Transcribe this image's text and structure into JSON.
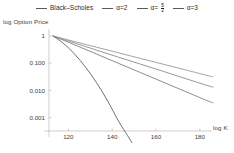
{
  "chart_data": {
    "type": "line",
    "title": "",
    "xlabel": "log K",
    "ylabel": "log Option Price",
    "xlim": [
      112,
      186
    ],
    "ylim": [
      0.0004,
      1.45
    ],
    "yscale": "log",
    "grid": false,
    "legend_position": "top",
    "xticks": [
      120,
      140,
      160,
      180
    ],
    "xtick_labels": [
      "120",
      "140",
      "160",
      "180"
    ],
    "yticks": [
      1,
      0.1,
      0.01,
      0.001
    ],
    "ytick_labels": [
      "1",
      "0.100",
      "0.010",
      "0.001"
    ],
    "series": [
      {
        "name": "Black-Scholes",
        "color": "#4c4c4c",
        "x": [
          113,
          118,
          123,
          128,
          133,
          138,
          143,
          147,
          149
        ],
        "y": [
          1.0,
          0.52,
          0.21,
          0.069,
          0.0185,
          0.004,
          0.00072,
          0.00022,
          0.00012
        ]
      },
      {
        "name": "alpha=2",
        "color": "#6e6e6e",
        "x": [
          113,
          123,
          133,
          143,
          153,
          163,
          173,
          183,
          186
        ],
        "y": [
          1.0,
          0.47,
          0.215,
          0.098,
          0.045,
          0.0205,
          0.0094,
          0.0043,
          0.0035
        ]
      },
      {
        "name": "alpha=5/2",
        "color": "#7d7d7d",
        "x": [
          113,
          123,
          133,
          143,
          153,
          163,
          173,
          183,
          186
        ],
        "y": [
          1.0,
          0.55,
          0.3,
          0.165,
          0.092,
          0.051,
          0.028,
          0.0155,
          0.0132
        ]
      },
      {
        "name": "alpha=3",
        "color": "#8c8c8c",
        "x": [
          113,
          123,
          133,
          143,
          153,
          163,
          173,
          183,
          186
        ],
        "y": [
          1.0,
          0.62,
          0.385,
          0.24,
          0.149,
          0.093,
          0.058,
          0.036,
          0.0315
        ]
      }
    ]
  },
  "legend": {
    "entries": [
      {
        "label": "Black–Scholes",
        "type": "text"
      },
      {
        "label": "α=2",
        "type": "text"
      },
      {
        "label": "α=",
        "type": "fraction",
        "numerator": "5",
        "denominator": "2"
      },
      {
        "label": "α=3",
        "type": "text"
      }
    ]
  },
  "axes": {
    "y_axis_label": "log Option Price",
    "x_axis_label": "log K"
  }
}
